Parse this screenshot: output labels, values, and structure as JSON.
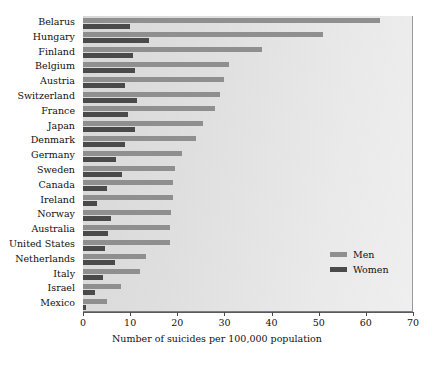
{
  "chart_data": {
    "type": "bar",
    "orientation": "horizontal",
    "title": "",
    "xlabel": "Number of suicides per 100,000 population",
    "ylabel": "",
    "xlim": [
      0,
      70
    ],
    "xticks": [
      0,
      10,
      20,
      30,
      40,
      50,
      60,
      70
    ],
    "grid": false,
    "legend_position": "inside-right",
    "categories": [
      "Belarus",
      "Hungary",
      "Finland",
      "Belgium",
      "Austria",
      "Switzerland",
      "France",
      "Japan",
      "Denmark",
      "Germany",
      "Sweden",
      "Canada",
      "Ireland",
      "Norway",
      "Australia",
      "United States",
      "Netherlands",
      "Italy",
      "Israel",
      "Mexico"
    ],
    "series": [
      {
        "name": "Men",
        "color": "#8f8f8f",
        "values": [
          63,
          51,
          38,
          31,
          30,
          29,
          28,
          25.5,
          24,
          21,
          19.5,
          19,
          19,
          18.7,
          18.5,
          18.5,
          13.3,
          12,
          8,
          5
        ]
      },
      {
        "name": "Women",
        "color": "#4a4a4a",
        "values": [
          10,
          14,
          10.5,
          11,
          9,
          11.5,
          9.5,
          11,
          9,
          7,
          8.3,
          5,
          3,
          6,
          5.3,
          4.7,
          6.8,
          4.3,
          2.5,
          0.7
        ]
      }
    ]
  },
  "legend": {
    "items": [
      {
        "label": "Men",
        "swatch": "men"
      },
      {
        "label": "Women",
        "swatch": "women"
      }
    ]
  },
  "colors": {
    "men": "#8f8f8f",
    "women": "#4a4a4a",
    "panel_light": "#efefef",
    "panel_dark": "#d8d8d8",
    "axis": "#4a4a4a"
  }
}
